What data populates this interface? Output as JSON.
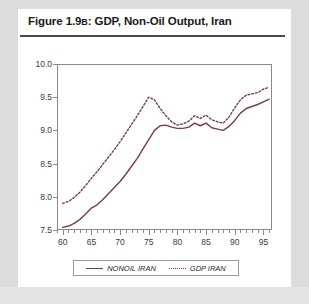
{
  "figure": {
    "title_prefix": "Figure 1.9",
    "title_marker": "B",
    "title_rest": ": GDP, Non-Oil Output, Iran"
  },
  "legend": {
    "position": "bottom-center",
    "entries": [
      {
        "label": "NONOIL IRAN",
        "style": "solid",
        "color": "#7a3a4a",
        "icon": "solid-line-icon"
      },
      {
        "label": "GDP IRAN",
        "style": "dotted",
        "color": "#7a3a4a",
        "icon": "dotted-line-icon"
      }
    ]
  },
  "colors": {
    "line": "#7a3a4a",
    "frame": "#8a8a8a",
    "card": "#ffffff",
    "page": "#d8d8d8",
    "title_rule": "#4a4a4a"
  },
  "chart_data": {
    "type": "line",
    "title": "Figure 1.9B: GDP, Non-Oil Output, Iran",
    "xlabel": "",
    "ylabel": "",
    "xlim": [
      59.0,
      96.5
    ],
    "ylim": [
      7.5,
      10.0
    ],
    "yticks": [
      7.5,
      8.0,
      8.5,
      9.0,
      9.5,
      10.0
    ],
    "ytick_labels": [
      "7.5",
      "8.0",
      "8.5",
      "9.0",
      "9.5",
      "10.0"
    ],
    "xticks": [
      60,
      65,
      70,
      75,
      80,
      85,
      90,
      95
    ],
    "xtick_labels": [
      "60",
      "65",
      "70",
      "75",
      "80",
      "85",
      "90",
      "95"
    ],
    "minor_xtick_step": 1,
    "grid": false,
    "x": [
      60,
      61,
      62,
      63,
      64,
      65,
      66,
      67,
      68,
      69,
      70,
      71,
      72,
      73,
      74,
      75,
      76,
      77,
      78,
      79,
      80,
      81,
      82,
      83,
      84,
      85,
      86,
      87,
      88,
      89,
      90,
      91,
      92,
      93,
      94,
      95,
      96
    ],
    "series": [
      {
        "name": "NONOIL IRAN",
        "style": "solid",
        "color": "#7a3a4a",
        "values": [
          7.54,
          7.56,
          7.6,
          7.66,
          7.74,
          7.83,
          7.88,
          7.96,
          8.05,
          8.14,
          8.23,
          8.34,
          8.46,
          8.58,
          8.72,
          8.86,
          9.0,
          9.07,
          9.08,
          9.05,
          9.03,
          9.03,
          9.05,
          9.11,
          9.07,
          9.11,
          9.04,
          9.02,
          9.0,
          9.06,
          9.15,
          9.26,
          9.33,
          9.36,
          9.39,
          9.43,
          9.47
        ]
      },
      {
        "name": "GDP IRAN",
        "style": "dotted",
        "color": "#7a3a4a",
        "values": [
          7.9,
          7.93,
          7.99,
          8.07,
          8.17,
          8.28,
          8.38,
          8.49,
          8.6,
          8.71,
          8.83,
          8.96,
          9.09,
          9.22,
          9.36,
          9.5,
          9.46,
          9.33,
          9.22,
          9.13,
          9.08,
          9.1,
          9.14,
          9.22,
          9.18,
          9.23,
          9.16,
          9.13,
          9.11,
          9.2,
          9.34,
          9.46,
          9.53,
          9.55,
          9.57,
          9.62,
          9.65
        ]
      }
    ]
  }
}
